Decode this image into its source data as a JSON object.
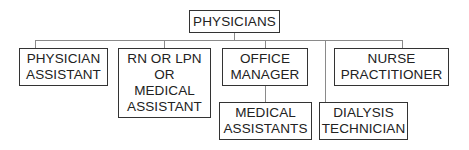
{
  "diagram": {
    "type": "org-chart",
    "root": {
      "label": "PHYSICIANS"
    },
    "children": [
      {
        "lines": [
          "PHYSICIAN",
          "ASSISTANT"
        ]
      },
      {
        "lines": [
          "RN OR LPN",
          "OR",
          "MEDICAL",
          "ASSISTANT"
        ]
      },
      {
        "lines": [
          "OFFICE",
          "MANAGER"
        ],
        "children": [
          {
            "lines": [
              "MEDICAL",
              "ASSISTANTS"
            ]
          }
        ]
      },
      {
        "lines": [
          "DIALYSIS",
          "TECHNICIAN"
        ]
      },
      {
        "lines": [
          "NURSE",
          "PRACTITIONER"
        ]
      }
    ]
  },
  "colors": {
    "border": "#333333",
    "connector": "#8a8a8a",
    "text": "#222222",
    "background": "#ffffff"
  }
}
